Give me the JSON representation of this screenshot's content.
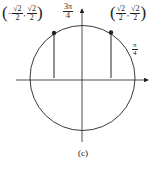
{
  "figure": {
    "caption": "(c)",
    "left_point": {
      "x_num": "√2",
      "x_den": "2",
      "x_sign": "−",
      "y_num": "√2",
      "y_den": "2",
      "open": "(",
      "close": ")",
      "sep": ","
    },
    "right_point": {
      "x_num": "√2",
      "x_den": "2",
      "y_num": "√2",
      "y_den": "2",
      "open": "(",
      "close": ")",
      "sep": ","
    },
    "top_angle": {
      "num": "3π",
      "den": "4"
    },
    "right_angle": {
      "num": "π",
      "den": "4"
    }
  },
  "colors": {
    "line": "#222222",
    "background": "#ffffff"
  }
}
